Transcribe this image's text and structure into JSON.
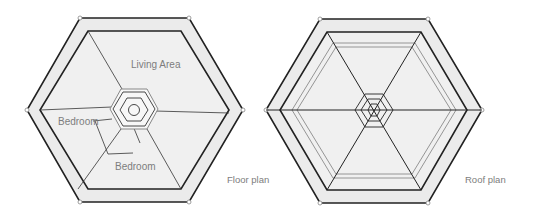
{
  "diagrams": [
    {
      "id": "floor",
      "caption": "Floor plan",
      "rooms": [
        {
          "label": "Living Area"
        },
        {
          "label": "Bedroom"
        },
        {
          "label": "Bedroom"
        }
      ]
    },
    {
      "id": "roof",
      "caption": "Roof plan"
    }
  ],
  "colors": {
    "stroke": "#222222",
    "light_stroke": "#8a8a8a",
    "ring_fill": "#ebebeb",
    "inner_fill": "#f0f0f0",
    "label": "#7d7d7d",
    "background": "#ffffff"
  }
}
